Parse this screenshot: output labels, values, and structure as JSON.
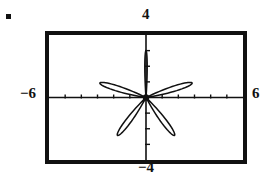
{
  "figure": {
    "bullet_marker": "•",
    "window": {
      "xmin": -6,
      "xmax": 6,
      "ymin": -4,
      "ymax": 4
    },
    "labels": {
      "left": "−6",
      "right": "6",
      "top": "4",
      "bottom": "−4"
    },
    "colors": {
      "frame": "#111111",
      "curve": "#111111",
      "axis": "#111111",
      "background": "#ffffff"
    }
  },
  "chart_data": {
    "type": "line",
    "title": "",
    "subtitle": "",
    "plot_kind": "polar-rose",
    "equation": "r = 3 sin(5θ)",
    "xlabel": "",
    "ylabel": "",
    "xlim": [
      -6,
      6
    ],
    "ylim": [
      -4,
      4
    ],
    "grid": false,
    "legend": "none",
    "axis_ticks": {
      "x_tick_spacing": 1,
      "x_tick_values": [
        -5,
        -4,
        -3,
        -2,
        -1,
        1,
        2,
        3,
        4,
        5
      ],
      "y_tick_spacing": 1,
      "y_tick_values": [
        -3,
        -2,
        -1,
        1,
        2,
        3
      ]
    },
    "annotations": [
      {
        "text": "−6",
        "position": "left-of-axis",
        "value": -6
      },
      {
        "text": "6",
        "position": "right-of-axis",
        "value": 6
      },
      {
        "text": "4",
        "position": "above-frame",
        "value": 4
      },
      {
        "text": "−4",
        "position": "below-frame",
        "value": -4
      }
    ],
    "petals": [
      {
        "name": "top",
        "angle_deg": 90,
        "length_r": 3.0,
        "half_width_deg": 4
      },
      {
        "name": "upper-left",
        "angle_deg": 162,
        "length_r": 3.0,
        "half_width_deg": 9
      },
      {
        "name": "upper-right",
        "angle_deg": 18,
        "length_r": 3.0,
        "half_width_deg": 9
      },
      {
        "name": "lower-left",
        "angle_deg": 234,
        "length_r": 3.0,
        "half_width_deg": 9
      },
      {
        "name": "lower-right",
        "angle_deg": 306,
        "length_r": 3.0,
        "half_width_deg": 9
      }
    ],
    "series": [
      {
        "name": "r = 3 sin(5 theta)",
        "theta_deg": [
          0,
          18,
          36,
          54,
          72,
          90,
          108,
          126,
          144,
          162,
          180,
          198,
          216,
          234,
          252,
          270,
          288,
          306,
          324,
          342,
          360
        ],
        "r": [
          0,
          3,
          0,
          -3,
          0,
          3,
          0,
          -3,
          0,
          3,
          0,
          -3,
          0,
          3,
          0,
          -3,
          0,
          3,
          0,
          -3,
          0
        ]
      }
    ]
  }
}
